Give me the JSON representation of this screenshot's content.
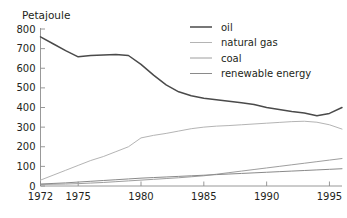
{
  "chart_data": {
    "type": "line",
    "title": "",
    "subtitle": "",
    "xlabel": "",
    "ylabel": "Petajoule",
    "ylim": [
      0,
      800
    ],
    "xlim": [
      1972,
      1996
    ],
    "grid": false,
    "legend_position": "top-right",
    "y_ticks": [
      "0",
      "100",
      "200",
      "300",
      "400",
      "500",
      "600",
      "700",
      "800"
    ],
    "y_tick_values": [
      0,
      100,
      200,
      300,
      400,
      500,
      600,
      700,
      800
    ],
    "x_ticks": [
      "1972",
      "1975",
      "1980",
      "1985",
      "1990",
      "1995"
    ],
    "x_tick_values": [
      1972,
      1975,
      1980,
      1985,
      1990,
      1995
    ],
    "x": [
      1972,
      1973,
      1974,
      1975,
      1976,
      1977,
      1978,
      1979,
      1980,
      1981,
      1982,
      1983,
      1984,
      1985,
      1986,
      1987,
      1988,
      1989,
      1990,
      1991,
      1992,
      1993,
      1994,
      1995,
      1996
    ],
    "series": [
      {
        "name": "oil",
        "color": "#4a4a4a",
        "values": [
          760,
          725,
          690,
          658,
          665,
          668,
          670,
          665,
          620,
          565,
          515,
          480,
          460,
          447,
          440,
          432,
          424,
          415,
          400,
          390,
          380,
          372,
          358,
          370,
          400
        ]
      },
      {
        "name": "natural gas",
        "color": "#b4b4b4",
        "values": [
          30,
          55,
          80,
          105,
          130,
          150,
          175,
          200,
          245,
          258,
          268,
          280,
          292,
          300,
          305,
          308,
          312,
          316,
          320,
          324,
          328,
          330,
          325,
          312,
          290
        ]
      },
      {
        "name": "coal",
        "color": "#9e9e9e",
        "values": [
          8,
          9,
          10,
          12,
          15,
          18,
          22,
          26,
          30,
          34,
          38,
          42,
          47,
          52,
          60,
          68,
          76,
          84,
          92,
          100,
          108,
          116,
          124,
          132,
          140
        ]
      },
      {
        "name": "renewable energy",
        "color": "#8a8a8a",
        "values": [
          10,
          13,
          16,
          20,
          24,
          28,
          32,
          36,
          40,
          43,
          46,
          49,
          52,
          55,
          58,
          61,
          64,
          67,
          70,
          73,
          76,
          79,
          82,
          85,
          88
        ]
      }
    ],
    "legend": [
      {
        "label": "oil",
        "color": "#4a4a4a"
      },
      {
        "label": "natural gas",
        "color": "#b4b4b4"
      },
      {
        "label": "coal",
        "color": "#9e9e9e"
      },
      {
        "label": "renewable energy",
        "color": "#8a8a8a"
      }
    ]
  }
}
